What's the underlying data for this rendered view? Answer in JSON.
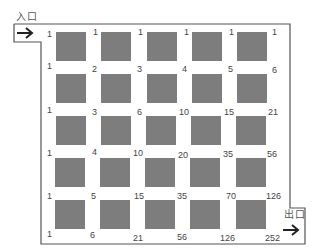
{
  "labels": {
    "entrance": "入口",
    "exit": "出口"
  },
  "icons": {
    "entrance_arrow": "arrow-right",
    "exit_arrow": "arrow-right"
  },
  "colors": {
    "block": "#7d7d7d",
    "border": "#555555",
    "text": "#444444"
  },
  "grid": {
    "rows": 6,
    "cols": 6,
    "values": [
      [
        "1",
        "1",
        "1",
        "1",
        "1",
        "1"
      ],
      [
        "1",
        "2",
        "3",
        "4",
        "5",
        "6"
      ],
      [
        "1",
        "3",
        "6",
        "10",
        "15",
        "21"
      ],
      [
        "1",
        "4",
        "10",
        "20",
        "35",
        "56"
      ],
      [
        "1",
        "5",
        "15",
        "35",
        "70",
        "126"
      ],
      [
        "1",
        "6",
        "21",
        "56",
        "126",
        "252"
      ]
    ]
  },
  "blocks": {
    "rows": 5,
    "cols": 5
  }
}
